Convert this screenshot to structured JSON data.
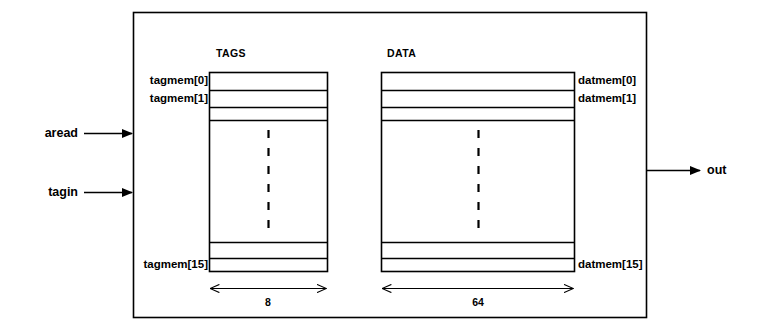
{
  "diagram": {
    "type": "block-diagram",
    "background_color": "#ffffff",
    "line_color": "#000000",
    "outer_block": {
      "x": 133,
      "y": 12,
      "width": 514,
      "height": 306
    },
    "inputs": [
      {
        "name": "aread",
        "label": "aread",
        "y": 133
      },
      {
        "name": "tagin",
        "label": "tagin",
        "y": 192
      }
    ],
    "outputs": [
      {
        "name": "out",
        "label": "out",
        "y": 170
      }
    ],
    "arrays": [
      {
        "id": "tags",
        "heading": "TAGS",
        "x": 209,
        "width": 119,
        "top": 72,
        "bottom": 272,
        "label_side": "left",
        "width_label": "8",
        "row_labels": [
          {
            "text": "tagmem[0]",
            "row": 0
          },
          {
            "text": "tagmem[1]",
            "row": 1
          },
          {
            "text": "tagmem[15]",
            "row": 4
          }
        ]
      },
      {
        "id": "data",
        "heading": "DATA",
        "x": 381,
        "width": 194,
        "top": 72,
        "bottom": 272,
        "label_side": "right",
        "width_label": "64",
        "row_labels": [
          {
            "text": "datmem[0]",
            "row": 0
          },
          {
            "text": "datmem[1]",
            "row": 1
          },
          {
            "text": "datmem[15]",
            "row": 4
          }
        ]
      }
    ],
    "row_dividers_y": [
      72,
      90,
      107,
      120,
      242,
      258,
      272
    ],
    "ellipsis": {
      "style": "vertical-dashed",
      "top": 130,
      "bottom": 228
    },
    "dimension_arrows": [
      {
        "for": "tags",
        "label": "8",
        "y": 288,
        "x1": 209,
        "x2": 328
      },
      {
        "for": "data",
        "label": "64",
        "y": 288,
        "x1": 381,
        "x2": 575
      }
    ]
  }
}
